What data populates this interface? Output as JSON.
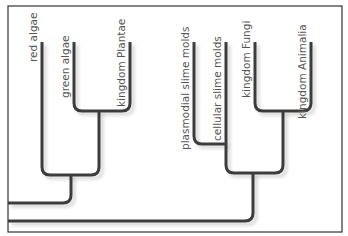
{
  "diagram": {
    "type": "cladogram",
    "taxa": [
      {
        "id": "red",
        "label": "red algae"
      },
      {
        "id": "green",
        "label": "green algae"
      },
      {
        "id": "plantae",
        "label": "kingdom Plantae"
      },
      {
        "id": "plasmodial",
        "label": "plasmodial slime molds"
      },
      {
        "id": "cellular",
        "label": "cellular slime molds"
      },
      {
        "id": "fungi",
        "label": "kingdom Fungi"
      },
      {
        "id": "animalia",
        "label": "kingdom Animalia"
      }
    ],
    "tree": "((red,(green,plantae)),((plasmodial,cellular),(fungi,animalia)))",
    "colors": {
      "branch": "#3c3c3c",
      "text": "#555555",
      "frame": "#333333"
    }
  }
}
